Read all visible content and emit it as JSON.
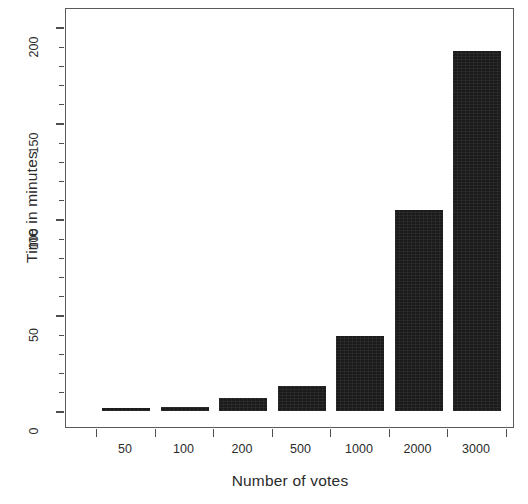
{
  "chart_data": {
    "type": "bar",
    "title": "",
    "xlabel": "Number of votes",
    "ylabel": "Time in minutes",
    "categories": [
      "50",
      "100",
      "200",
      "500",
      "1000",
      "2000",
      "3000"
    ],
    "values": [
      1.5,
      2,
      6.8,
      13,
      39,
      104.5,
      187.5
    ],
    "ylim": [
      0,
      218
    ],
    "ytick_labels": [
      "0",
      "50",
      "100",
      "150",
      "200"
    ],
    "ytick_values": [
      0,
      50,
      100,
      150,
      200
    ],
    "yminor_values": [
      10,
      20,
      30,
      40,
      60,
      70,
      80,
      90,
      110,
      120,
      130,
      140,
      160,
      170,
      180,
      190,
      200,
      210
    ],
    "xtick_labels": [
      "50",
      "100",
      "200",
      "500",
      "1000",
      "2000",
      "3000"
    ],
    "grid": false,
    "legend": null,
    "bar_color": "#1b1b1b",
    "frame_color": "#5a5a5a",
    "background": "#ffffff"
  },
  "axes": {
    "y_title": "Time in minutes",
    "x_title": "Number of votes"
  }
}
